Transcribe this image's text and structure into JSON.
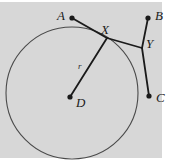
{
  "figure": {
    "width": 175,
    "height": 168,
    "background_color": "#d7d7d7",
    "paper_color": "#ffffff",
    "ink_color": "#1a1a1a",
    "circle_stroke": "#4a4a4a"
  },
  "circle": {
    "name": "circle-D",
    "center_label": "D",
    "cx": 72,
    "cy": 93,
    "r": 66,
    "stroke_width": 1.1
  },
  "points": [
    {
      "id": "A",
      "label": "A",
      "x": 72,
      "y": 18,
      "dot": true,
      "label_x": 57,
      "label_y": 9
    },
    {
      "id": "B",
      "label": "B",
      "x": 148,
      "y": 18,
      "dot": true,
      "label_x": 155,
      "label_y": 9
    },
    {
      "id": "C",
      "label": "C",
      "x": 149,
      "y": 96,
      "dot": true,
      "label_x": 156,
      "label_y": 91
    },
    {
      "id": "D",
      "label": "D",
      "x": 70,
      "y": 97,
      "dot": true,
      "label_x": 76,
      "label_y": 96
    },
    {
      "id": "X",
      "label": "X",
      "x": 107,
      "y": 38,
      "dot": false,
      "label_x": 101,
      "label_y": 23
    },
    {
      "id": "Y",
      "label": "Y",
      "x": 142,
      "y": 48,
      "dot": false,
      "label_x": 146,
      "label_y": 37
    }
  ],
  "segments": [
    {
      "id": "AX",
      "from": "A",
      "to": "X",
      "x1": 72,
      "y1": 18,
      "x2": 107,
      "y2": 38,
      "width": 1.8
    },
    {
      "id": "XY",
      "from": "X",
      "to": "Y",
      "x1": 107,
      "y1": 38,
      "x2": 142,
      "y2": 48,
      "width": 1.8
    },
    {
      "id": "XD",
      "from": "X",
      "to": "D",
      "x1": 107,
      "y1": 38,
      "x2": 70,
      "y2": 97,
      "width": 1.8
    },
    {
      "id": "BY",
      "from": "B",
      "to": "Y",
      "x1": 148,
      "y1": 18,
      "x2": 142,
      "y2": 48,
      "width": 1.8
    },
    {
      "id": "YC",
      "from": "Y",
      "to": "C",
      "x1": 142,
      "y1": 48,
      "x2": 149,
      "y2": 96,
      "width": 1.8
    }
  ],
  "segment_labels": [
    {
      "id": "r",
      "label": "r",
      "for_segment": "XD",
      "x": 78,
      "y": 62
    }
  ]
}
